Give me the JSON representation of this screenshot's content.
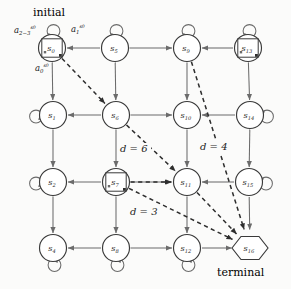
{
  "diagram": {
    "type": "state-transition-grid-mdp",
    "title_annotations": {
      "initial_label": "initial",
      "terminal_label": "terminal"
    },
    "colors": {
      "node_stroke": "#3a3a3a",
      "node_fill": "#ffffff",
      "edge": "#6b6b6b",
      "dashed_edge": "#2e2e2e",
      "text": "#1c1c1c",
      "background": "#fbfbfa"
    },
    "nodes": [
      {
        "id": "s0",
        "label": "s",
        "sub": "0",
        "x": 52,
        "y": 48,
        "shape": "circle",
        "boxed": true,
        "selfloop": "top",
        "role": "initial"
      },
      {
        "id": "s5",
        "label": "s",
        "sub": "5",
        "x": 115,
        "y": 48,
        "shape": "circle",
        "boxed": false,
        "selfloop": "top",
        "role": "normal"
      },
      {
        "id": "s9",
        "label": "s",
        "sub": "9",
        "x": 187,
        "y": 48,
        "shape": "circle",
        "boxed": false,
        "selfloop": "top",
        "role": "normal"
      },
      {
        "id": "s13",
        "label": "s",
        "sub": "13",
        "x": 248,
        "y": 48,
        "shape": "circle",
        "boxed": true,
        "selfloop": "top",
        "role": "normal"
      },
      {
        "id": "s1",
        "label": "s",
        "sub": "1",
        "x": 53,
        "y": 115,
        "shape": "circle",
        "boxed": false,
        "selfloop": "left",
        "role": "normal"
      },
      {
        "id": "s6",
        "label": "s",
        "sub": "6",
        "x": 116,
        "y": 115,
        "shape": "circle",
        "boxed": false,
        "selfloop": "none",
        "role": "normal"
      },
      {
        "id": "s10",
        "label": "s",
        "sub": "10",
        "x": 187,
        "y": 115,
        "shape": "circle",
        "boxed": false,
        "selfloop": "none",
        "role": "normal"
      },
      {
        "id": "s14",
        "label": "s",
        "sub": "14",
        "x": 250,
        "y": 115,
        "shape": "circle",
        "boxed": false,
        "selfloop": "right",
        "role": "normal"
      },
      {
        "id": "s2",
        "label": "s",
        "sub": "2",
        "x": 53,
        "y": 182,
        "shape": "circle",
        "boxed": false,
        "selfloop": "left",
        "role": "normal"
      },
      {
        "id": "s7",
        "label": "s",
        "sub": "7",
        "x": 116,
        "y": 182,
        "shape": "circle",
        "boxed": true,
        "selfloop": "none",
        "role": "normal"
      },
      {
        "id": "s11",
        "label": "s",
        "sub": "11",
        "x": 187,
        "y": 182,
        "shape": "circle",
        "boxed": false,
        "selfloop": "none",
        "role": "normal"
      },
      {
        "id": "s15",
        "label": "s",
        "sub": "15",
        "x": 249,
        "y": 182,
        "shape": "circle",
        "boxed": false,
        "selfloop": "right",
        "role": "normal"
      },
      {
        "id": "s4",
        "label": "s",
        "sub": "4",
        "x": 53,
        "y": 248,
        "shape": "circle",
        "boxed": false,
        "selfloop": "bottom",
        "role": "normal"
      },
      {
        "id": "s8",
        "label": "s",
        "sub": "8",
        "x": 116,
        "y": 248,
        "shape": "circle",
        "boxed": false,
        "selfloop": "bottom",
        "role": "normal"
      },
      {
        "id": "s12",
        "label": "s",
        "sub": "12",
        "x": 187,
        "y": 248,
        "shape": "circle",
        "boxed": false,
        "selfloop": "bottom",
        "role": "normal"
      },
      {
        "id": "s16",
        "label": "s",
        "sub": "16",
        "x": 250,
        "y": 248,
        "shape": "hexagon",
        "boxed": false,
        "selfloop": "none",
        "role": "terminal"
      }
    ],
    "action_labels": [
      {
        "id": "a23",
        "base": "a",
        "sub": "2−3",
        "sup": "s0",
        "x": 14,
        "y": 33
      },
      {
        "id": "a1",
        "base": "a",
        "sub": "1",
        "sup": "s0",
        "x": 71,
        "y": 32
      },
      {
        "id": "a0",
        "base": "a",
        "sub": "0",
        "sup": "s0",
        "x": 35,
        "y": 71
      }
    ],
    "distance_labels": [
      {
        "id": "d6",
        "text": "d = 6",
        "x": 120,
        "y": 152
      },
      {
        "id": "d4",
        "text": "d = 4",
        "x": 200,
        "y": 150
      },
      {
        "id": "d3",
        "text": "d = 3",
        "x": 130,
        "y": 215
      }
    ],
    "solid_edges": [
      {
        "from": "s5",
        "to": "s0",
        "dir": "left"
      },
      {
        "from": "s5",
        "to": "s9",
        "dir": "right-bi"
      },
      {
        "from": "s13",
        "to": "s9",
        "dir": "left"
      },
      {
        "from": "s6",
        "to": "s1",
        "dir": "left"
      },
      {
        "from": "s6",
        "to": "s10",
        "dir": "right-bi"
      },
      {
        "from": "s14",
        "to": "s10",
        "dir": "left"
      },
      {
        "from": "s7",
        "to": "s2",
        "dir": "left"
      },
      {
        "from": "s7",
        "to": "s11",
        "dir": "right-bi"
      },
      {
        "from": "s15",
        "to": "s11",
        "dir": "left"
      },
      {
        "from": "s8",
        "to": "s4",
        "dir": "left"
      },
      {
        "from": "s8",
        "to": "s12",
        "dir": "right-bi"
      },
      {
        "from": "s12",
        "to": "s16",
        "dir": "right"
      },
      {
        "from": "s0",
        "to": "s1",
        "dir": "down-bi"
      },
      {
        "from": "s5",
        "to": "s6",
        "dir": "down-bi"
      },
      {
        "from": "s9",
        "to": "s10",
        "dir": "down-bi"
      },
      {
        "from": "s13",
        "to": "s14",
        "dir": "down-bi"
      },
      {
        "from": "s1",
        "to": "s2",
        "dir": "down-bi"
      },
      {
        "from": "s6",
        "to": "s7",
        "dir": "down-bi"
      },
      {
        "from": "s10",
        "to": "s11",
        "dir": "down-bi"
      },
      {
        "from": "s14",
        "to": "s15",
        "dir": "down-bi"
      },
      {
        "from": "s2",
        "to": "s4",
        "dir": "down-bi"
      },
      {
        "from": "s7",
        "to": "s8",
        "dir": "down-bi"
      },
      {
        "from": "s11",
        "to": "s12",
        "dir": "down-bi"
      },
      {
        "from": "s15",
        "to": "s16",
        "dir": "down"
      }
    ],
    "dashed_edges": [
      {
        "from": "s0",
        "to": "s6",
        "label": null
      },
      {
        "from": "s6",
        "to": "s11",
        "label": "d = 6"
      },
      {
        "from": "s7",
        "to": "s11",
        "label": null
      },
      {
        "from": "s7",
        "to": "s16",
        "label": "d = 3"
      },
      {
        "from": "s11",
        "to": "s16",
        "label": null
      },
      {
        "from": "s9",
        "to": "s16",
        "label": "d = 4"
      }
    ]
  }
}
